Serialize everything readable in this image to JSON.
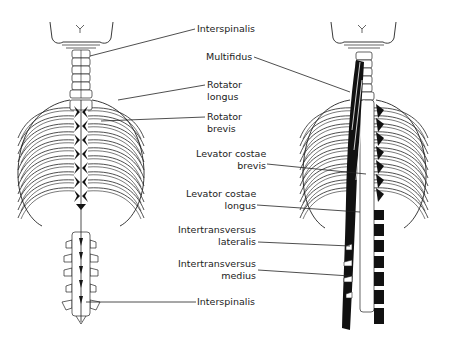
{
  "figure": {
    "left_panel": {
      "view": "posterior, deep back muscles (left)",
      "labels": [
        {
          "id": "interspinalis-top",
          "lines": [
            "Interspinalis"
          ]
        },
        {
          "id": "rotator-longus",
          "lines": [
            "Rotator",
            "longus"
          ]
        },
        {
          "id": "rotator-brevis",
          "lines": [
            "Rotator",
            "brevis"
          ]
        },
        {
          "id": "interspinalis-bottom",
          "lines": [
            "Interspinalis"
          ]
        }
      ]
    },
    "right_panel": {
      "view": "posterior, deep back muscles (right)",
      "labels": [
        {
          "id": "multifidus",
          "lines": [
            "Multifidus"
          ]
        },
        {
          "id": "levator-costae-brevis",
          "lines": [
            "Levator costae",
            "brevis"
          ]
        },
        {
          "id": "levator-costae-longus",
          "lines": [
            "Levator costae",
            "longus"
          ]
        },
        {
          "id": "intertransversus-lateralis",
          "lines": [
            "Intertransversus",
            "lateralis"
          ]
        },
        {
          "id": "intertransversus-medius",
          "lines": [
            "Intertransversus",
            "medius"
          ]
        }
      ]
    },
    "colors": {
      "line": "#222222",
      "muscle": "#111111",
      "bone_fill": "#ffffff"
    }
  }
}
